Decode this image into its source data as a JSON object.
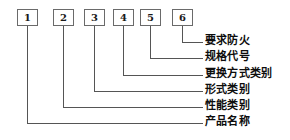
{
  "diagram": {
    "type": "model-designation-callout-diagram",
    "colors": {
      "background": "#ffffff",
      "line": "#555555",
      "box_border": "#6a6a6a",
      "text": "#0d0d0d"
    },
    "boxes": [
      {
        "id": "box-1",
        "label": "1",
        "x": 17,
        "y": 9,
        "w": 21,
        "h": 17,
        "center_x": 27.5
      },
      {
        "id": "box-2",
        "label": "2",
        "x": 53,
        "y": 9,
        "w": 21,
        "h": 17,
        "center_x": 63.5
      },
      {
        "id": "box-3",
        "label": "3",
        "x": 84,
        "y": 9,
        "w": 21,
        "h": 17,
        "center_x": 94.5
      },
      {
        "id": "box-4",
        "label": "4",
        "x": 113,
        "y": 9,
        "w": 21,
        "h": 17,
        "center_x": 123.5
      },
      {
        "id": "box-5",
        "label": "5",
        "x": 140,
        "y": 9,
        "w": 21,
        "h": 17,
        "center_x": 150.5
      },
      {
        "id": "box-6",
        "label": "6",
        "x": 172,
        "y": 9,
        "w": 21,
        "h": 17,
        "center_x": 182.5
      }
    ],
    "callouts": [
      {
        "id": "callout-6",
        "box_ref": "6",
        "label": "要求防火",
        "line_y": 42,
        "stem_x": 182.5,
        "line_end_x": 203,
        "label_x": 205,
        "label_y": 35
      },
      {
        "id": "callout-5",
        "box_ref": "5",
        "label": "规格代号",
        "line_y": 58,
        "stem_x": 150.5,
        "line_end_x": 203,
        "label_x": 205,
        "label_y": 51
      },
      {
        "id": "callout-4",
        "box_ref": "4",
        "label": "更换方式类别",
        "line_y": 75,
        "stem_x": 123.5,
        "line_end_x": 203,
        "label_x": 205,
        "label_y": 68
      },
      {
        "id": "callout-3",
        "box_ref": "3",
        "label": "形式类别",
        "line_y": 91,
        "stem_x": 94.5,
        "line_end_x": 203,
        "label_x": 205,
        "label_y": 84
      },
      {
        "id": "callout-2",
        "box_ref": "2",
        "label": "性能类别",
        "line_y": 107,
        "stem_x": 63.5,
        "line_end_x": 203,
        "label_x": 205,
        "label_y": 100
      },
      {
        "id": "callout-1",
        "box_ref": "1",
        "label": "产品名称",
        "line_y": 123,
        "stem_x": 27.5,
        "line_end_x": 203,
        "label_x": 205,
        "label_y": 116
      }
    ]
  }
}
